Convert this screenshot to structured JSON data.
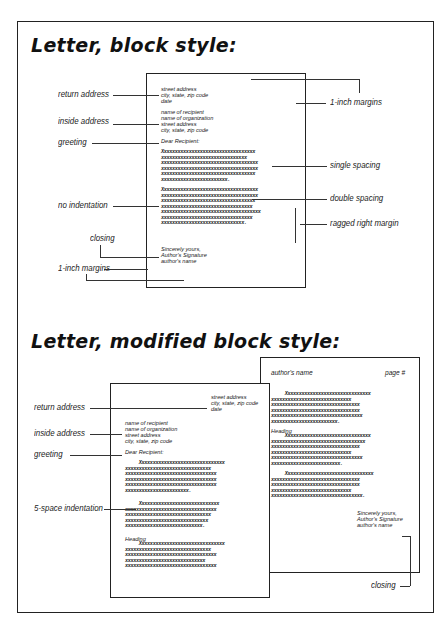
{
  "block_style": {
    "title": "Letter, block style:",
    "letter": {
      "return_address": [
        "street address",
        "city, state, zip code",
        "date"
      ],
      "inside_address": [
        "name of recipient",
        "name of organization",
        "street address",
        "city, state, zip code"
      ],
      "greeting": "Dear Recipient:",
      "paragraph1": "Xxxxxxxxxxxxxxxxxxxxxxxxxxxxxxxxxx\nxxxxxxxxxxxxxxxxxxxxxxxxxxxxxxx\nxxxxxxxxxxxxxxxxxxxxxxxxxxxxxxxxxxx\nxxxxxxxxxxxxxxxxxxxxxxxxxxxxxxxxxxx\nxxxxxxxxxxxxxxxxxxxxxxxxxxxxxxxxxx\nxxxxxxxxxxxxxxxxxxxxxxxx.",
      "paragraph2": "Xxxxxxxxxxxxxxxxxxxxxxxxxxxxxxxxxxx\nxxxxxxxxxxxxxxxxxxxxxxxxxxxxxxxxxxx\nxxxxxxxxxxxxxxxxxxxxxxxxxxxxxxxxxx\nxxxxxxxxxxxxxxxxxxxxxxxxxxxxxxxxx\nxxxxxxxxxxxxxxxxxxxxxxxxxxxxxxxxxxxx\nxxxxxxxxxxxxxxxxxxxxxxxxxxxxxxxxx\nxxxxxxxxxxxxxxxxxxxxxxxxxxxxxx.",
      "closing": [
        "Sincerely yours,",
        "Author's Signature",
        "author's name"
      ]
    },
    "labels": {
      "return_address": "return address",
      "inside_address": "inside address",
      "greeting": "greeting",
      "no_indentation": "no indentation",
      "closing": "closing",
      "margins_left": "1-inch margins",
      "margins_right": "1-inch margins",
      "single_spacing": "single spacing",
      "double_spacing": "double spacing",
      "ragged_right": "ragged right margin"
    }
  },
  "modified_block_style": {
    "title": "Letter, modified block style:",
    "page1": {
      "return_address": [
        "street address",
        "city, state, zip code",
        "date"
      ],
      "inside_address": [
        "name of recipient",
        "name of organization",
        "street address",
        "city, state, zip code"
      ],
      "greeting": "Dear Recipient:",
      "paragraph1": "     Xxxxxxxxxxxxxxxxxxxxxxxxxxxxxxx\nxxxxxxxxxxxxxxxxxxxxxxxxxxxxxxx\nxxxxxxxxxxxxxxxxxxxxxxxxxxxxxxxxx\nxxxxxxxxxxxxxxxxxxxxxxxxxxxxxxxxx\nxxxxxxxxxxxxxxxxxxxxxxxxxxxxxxxxx\nxxxxxxxxxxxxxxxxxxxxxxx.",
      "paragraph2": "     Xxxxxxxxxxxxxxxxxxxxxxxxxxxxx\nxxxxxxxxxxxxxxxxxxxxxxxxxxxxxxxxx\nxxxxxxxxxxxxxxxxxxxxxxxxxxxxxxx\nxxxxxxxxxxxxxxxxxxxxxxxxxxxxxx\nxxxxxxxxxxxxxxxxxxxxxxxxxxxx.",
      "heading": "Heading",
      "paragraph3": "     Xxxxxxxxxxxxxxxxxxxxxxxxxxxxxxx\nxxxxxxxxxxxxxxxxxxxxxxxxxxxxxxx\nxxxxxxxxxxxxxxxxxxxxxxxxxxxxxxxxx\nxxxxxxxxxxxxxxxxxxxxxxxxxxxxx\nxxxxxxxxxxxxxxxxxxxxxxxxxxxxxxxxx"
    },
    "page2": {
      "header_name": "author's name",
      "header_page": "page #",
      "paragraph1": "     Xxxxxxxxxxxxxxxxxxxxxxxxxxxxxxx\nxxxxxxxxxxxxxxxxxxxxxxxxxxxxx\nxxxxxxxxxxxxxxxxxxxxxxxxxxxxxxxx\nxxxxxxxxxxxxxxxxxxxxxxxxxxxxxxxx\nxxxxxxxxxxxxxxxxxxxxxxxxxxxxxxxxx\nxxxxxxxxxxxxxxxxxxxxxxxx.",
      "heading": "Heading",
      "paragraph2": "     Xxxxxxxxxxxxxxxxxxxxxxxxxxxxxxx\nxxxxxxxxxxxxxxxxxxxxxxxxxxxxxxxxxx\nxxxxxxxxxxxxxxxxxxxxxxxxxxxxxxxx\nxxxxxxxxxxxxxxxxxxxxxxxxxxxxx\nxxxxxxxxxxxxxxxxxxxxxxxxxxxxxxxxx\nxxxxxxxxxxxxxxxxxxxxxxxxx.",
      "paragraph3": "     Xxxxxxxxxxxxxxxxxxxxxxxxxxxxxxxx\nxxxxxxxxxxxxxxxxxxxxxxxxxxxxxxxx\nxxxxxxxxxxxxxxxxxxxxxxxxxxxxxxxx\nxxxxxxxxxxxxxxxxxxxxxxxxxxxxx\nxxxxxxxxxxxxxxxxxxxxxxxxxxxxxxxxx.",
      "closing": [
        "Sincerely yours,",
        "Author's Signature",
        "author's name"
      ]
    },
    "labels": {
      "return_address": "return address",
      "inside_address": "inside address",
      "greeting": "greeting",
      "indentation": "5-space indentation",
      "closing": "closing"
    }
  }
}
